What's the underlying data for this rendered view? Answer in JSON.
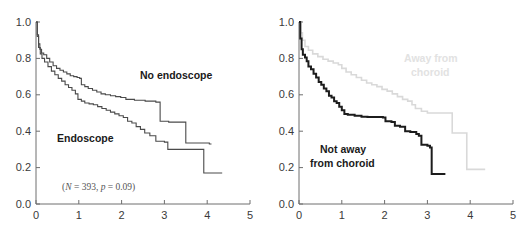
{
  "figure": {
    "panels": [
      {
        "id": "left",
        "annotation": {
          "full": "(N = 393,  p = 0.09)",
          "n_symbol": "N",
          "n_value": "393",
          "p_symbol": "p",
          "p_value": "0.09"
        },
        "labels": [
          {
            "name": "no-endoscope",
            "text": "No endoscope",
            "style": "dark"
          },
          {
            "name": "endoscope",
            "text": "Endoscope",
            "style": "dark"
          }
        ]
      },
      {
        "id": "right",
        "labels": [
          {
            "name": "away-from-choroid",
            "text_line1": "Away from",
            "text_line2": "choroid",
            "style": "faded"
          },
          {
            "name": "not-away-from-choroid",
            "text_line1": "Not away",
            "text_line2": "from choroid",
            "style": "dark"
          }
        ]
      }
    ],
    "colors": {
      "dark_curve": "#4a4a4a",
      "bold_curve": "#1c1c1c",
      "light_curve": "#d9d9d9",
      "axis": "#6e6e6e",
      "tick_text": "#3a3a3a",
      "faded_label": "#e2e2e2"
    }
  },
  "chart_data": [
    {
      "type": "line",
      "id": "left-panel",
      "title": "",
      "subtype": "kaplan-meier-step",
      "xlabel": "",
      "ylabel": "",
      "xlim": [
        0,
        5
      ],
      "ylim": [
        0.0,
        1.0
      ],
      "xticks": [
        "0",
        "1",
        "2",
        "3",
        "4",
        "5"
      ],
      "yticks": [
        "0.0",
        "0.2",
        "0.4",
        "0.6",
        "0.8",
        "1.0"
      ],
      "grid": false,
      "legend_position": "inline-annotation",
      "annotations": [
        "(N = 393,  p = 0.09)"
      ],
      "series": [
        {
          "name": "No endoscope",
          "color": "#4a4a4a",
          "points_xy": [
            [
              0.0,
              1.0
            ],
            [
              0.03,
              0.93
            ],
            [
              0.06,
              0.88
            ],
            [
              0.09,
              0.85
            ],
            [
              0.13,
              0.83
            ],
            [
              0.18,
              0.82
            ],
            [
              0.25,
              0.8
            ],
            [
              0.32,
              0.78
            ],
            [
              0.4,
              0.76
            ],
            [
              0.48,
              0.745
            ],
            [
              0.56,
              0.735
            ],
            [
              0.64,
              0.725
            ],
            [
              0.72,
              0.715
            ],
            [
              0.8,
              0.705
            ],
            [
              0.88,
              0.7
            ],
            [
              0.96,
              0.695
            ],
            [
              1.02,
              0.69
            ],
            [
              1.06,
              0.655
            ],
            [
              1.14,
              0.645
            ],
            [
              1.22,
              0.635
            ],
            [
              1.32,
              0.625
            ],
            [
              1.42,
              0.615
            ],
            [
              1.52,
              0.605
            ],
            [
              1.62,
              0.6
            ],
            [
              1.74,
              0.595
            ],
            [
              1.86,
              0.59
            ],
            [
              1.98,
              0.585
            ],
            [
              2.1,
              0.575
            ],
            [
              2.3,
              0.57
            ],
            [
              2.55,
              0.565
            ],
            [
              2.8,
              0.56
            ],
            [
              2.88,
              0.56
            ],
            [
              2.9,
              0.455
            ],
            [
              3.1,
              0.45
            ],
            [
              3.3,
              0.45
            ],
            [
              3.48,
              0.45
            ],
            [
              3.5,
              0.335
            ],
            [
              3.7,
              0.335
            ],
            [
              3.9,
              0.335
            ],
            [
              4.05,
              0.33
            ],
            [
              4.1,
              0.33
            ]
          ]
        },
        {
          "name": "Endoscope",
          "color": "#4a4a4a",
          "points_xy": [
            [
              0.0,
              1.0
            ],
            [
              0.03,
              0.92
            ],
            [
              0.06,
              0.86
            ],
            [
              0.1,
              0.825
            ],
            [
              0.14,
              0.8
            ],
            [
              0.2,
              0.78
            ],
            [
              0.28,
              0.755
            ],
            [
              0.36,
              0.73
            ],
            [
              0.44,
              0.71
            ],
            [
              0.52,
              0.69
            ],
            [
              0.6,
              0.675
            ],
            [
              0.68,
              0.655
            ],
            [
              0.76,
              0.64
            ],
            [
              0.84,
              0.625
            ],
            [
              0.92,
              0.605
            ],
            [
              0.98,
              0.575
            ],
            [
              1.06,
              0.565
            ],
            [
              1.14,
              0.555
            ],
            [
              1.24,
              0.55
            ],
            [
              1.34,
              0.545
            ],
            [
              1.44,
              0.535
            ],
            [
              1.54,
              0.525
            ],
            [
              1.64,
              0.515
            ],
            [
              1.74,
              0.505
            ],
            [
              1.84,
              0.495
            ],
            [
              1.94,
              0.485
            ],
            [
              2.04,
              0.475
            ],
            [
              2.14,
              0.455
            ],
            [
              2.24,
              0.445
            ],
            [
              2.34,
              0.425
            ],
            [
              2.44,
              0.41
            ],
            [
              2.54,
              0.39
            ],
            [
              2.66,
              0.375
            ],
            [
              2.8,
              0.345
            ],
            [
              3.0,
              0.34
            ],
            [
              3.08,
              0.3
            ],
            [
              3.3,
              0.3
            ],
            [
              3.55,
              0.3
            ],
            [
              3.8,
              0.3
            ],
            [
              3.88,
              0.3
            ],
            [
              3.92,
              0.17
            ],
            [
              4.2,
              0.17
            ],
            [
              4.35,
              0.17
            ]
          ]
        }
      ]
    },
    {
      "type": "line",
      "id": "right-panel",
      "title": "",
      "subtype": "kaplan-meier-step",
      "xlabel": "",
      "ylabel": "",
      "xlim": [
        0,
        5
      ],
      "ylim": [
        0.0,
        1.0
      ],
      "xticks": [
        "0",
        "1",
        "2",
        "3",
        "4",
        "5"
      ],
      "yticks": [
        "0.0",
        "0.2",
        "0.4",
        "0.6",
        "0.8",
        "1.0"
      ],
      "grid": false,
      "legend_position": "inline-labels",
      "annotations": [],
      "series": [
        {
          "name": "Away from choroid",
          "color": "#d9d9d9",
          "points_xy": [
            [
              0.0,
              1.0
            ],
            [
              0.04,
              0.94
            ],
            [
              0.08,
              0.9
            ],
            [
              0.14,
              0.865
            ],
            [
              0.22,
              0.845
            ],
            [
              0.32,
              0.825
            ],
            [
              0.44,
              0.81
            ],
            [
              0.56,
              0.795
            ],
            [
              0.68,
              0.785
            ],
            [
              0.8,
              0.775
            ],
            [
              0.92,
              0.765
            ],
            [
              1.0,
              0.745
            ],
            [
              1.1,
              0.725
            ],
            [
              1.22,
              0.71
            ],
            [
              1.34,
              0.695
            ],
            [
              1.46,
              0.68
            ],
            [
              1.58,
              0.665
            ],
            [
              1.7,
              0.655
            ],
            [
              1.82,
              0.645
            ],
            [
              1.94,
              0.63
            ],
            [
              2.06,
              0.62
            ],
            [
              2.18,
              0.605
            ],
            [
              2.3,
              0.59
            ],
            [
              2.42,
              0.575
            ],
            [
              2.54,
              0.565
            ],
            [
              2.64,
              0.545
            ],
            [
              2.72,
              0.525
            ],
            [
              2.86,
              0.51
            ],
            [
              3.0,
              0.5
            ],
            [
              3.4,
              0.5
            ],
            [
              3.55,
              0.5
            ],
            [
              3.58,
              0.39
            ],
            [
              3.8,
              0.39
            ],
            [
              3.88,
              0.39
            ],
            [
              3.92,
              0.19
            ],
            [
              4.2,
              0.19
            ],
            [
              4.35,
              0.19
            ]
          ]
        },
        {
          "name": "Not away from choroid",
          "color": "#1c1c1c",
          "points_xy": [
            [
              0.0,
              1.0
            ],
            [
              0.03,
              0.91
            ],
            [
              0.06,
              0.85
            ],
            [
              0.09,
              0.82
            ],
            [
              0.14,
              0.805
            ],
            [
              0.18,
              0.785
            ],
            [
              0.22,
              0.755
            ],
            [
              0.28,
              0.74
            ],
            [
              0.34,
              0.715
            ],
            [
              0.4,
              0.695
            ],
            [
              0.46,
              0.67
            ],
            [
              0.52,
              0.655
            ],
            [
              0.58,
              0.635
            ],
            [
              0.64,
              0.62
            ],
            [
              0.7,
              0.595
            ],
            [
              0.76,
              0.585
            ],
            [
              0.82,
              0.565
            ],
            [
              0.88,
              0.555
            ],
            [
              0.94,
              0.535
            ],
            [
              1.0,
              0.515
            ],
            [
              1.06,
              0.495
            ],
            [
              1.14,
              0.49
            ],
            [
              1.3,
              0.485
            ],
            [
              1.46,
              0.48
            ],
            [
              1.6,
              0.478
            ],
            [
              1.8,
              0.478
            ],
            [
              1.96,
              0.475
            ],
            [
              2.02,
              0.455
            ],
            [
              2.16,
              0.45
            ],
            [
              2.24,
              0.43
            ],
            [
              2.36,
              0.425
            ],
            [
              2.48,
              0.4
            ],
            [
              2.6,
              0.395
            ],
            [
              2.74,
              0.385
            ],
            [
              2.8,
              0.375
            ],
            [
              2.86,
              0.325
            ],
            [
              3.0,
              0.32
            ],
            [
              3.06,
              0.31
            ],
            [
              3.1,
              0.165
            ],
            [
              3.3,
              0.165
            ],
            [
              3.42,
              0.165
            ]
          ]
        }
      ]
    }
  ]
}
